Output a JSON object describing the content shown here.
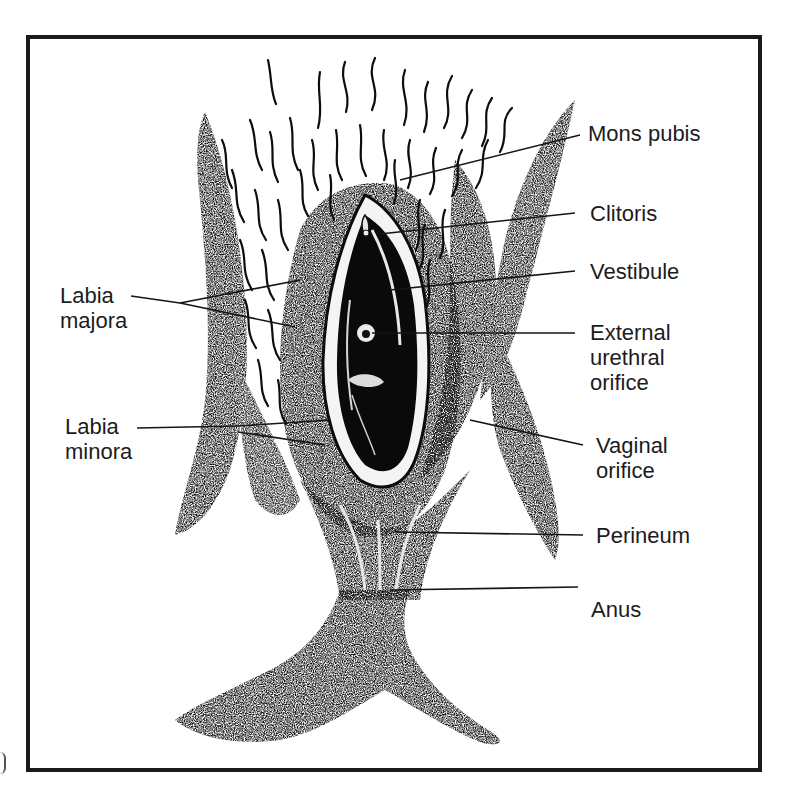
{
  "diagram": {
    "frame": {
      "border_color": "#1a1a1a",
      "background": "#ffffff"
    },
    "ink_color": "#0d0d0d",
    "labels_right": [
      {
        "id": "mons-pubis",
        "lines": [
          "Mons pubis"
        ]
      },
      {
        "id": "clitoris",
        "lines": [
          "Clitoris"
        ]
      },
      {
        "id": "vestibule",
        "lines": [
          "Vestibule"
        ]
      },
      {
        "id": "external-urethral-orifice",
        "lines": [
          "External",
          "urethral",
          "orifice"
        ]
      },
      {
        "id": "vaginal-orifice",
        "lines": [
          "Vaginal",
          "orifice"
        ]
      },
      {
        "id": "perineum",
        "lines": [
          "Perineum"
        ]
      },
      {
        "id": "anus",
        "lines": [
          "Anus"
        ]
      }
    ],
    "labels_left": [
      {
        "id": "labia-majora",
        "lines": [
          "Labia",
          "majora"
        ]
      },
      {
        "id": "labia-minora",
        "lines": [
          "Labia",
          "minora"
        ]
      }
    ]
  }
}
